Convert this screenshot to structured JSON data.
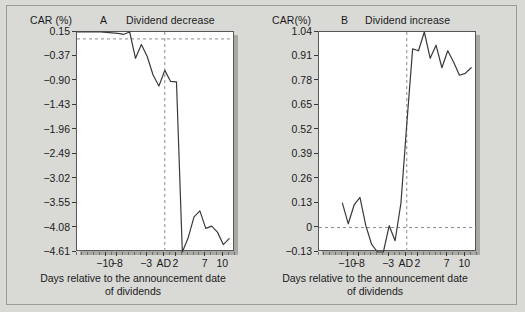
{
  "figure": {
    "background_color": "#d9d9d6",
    "plot_background_color": "#ffffff",
    "line_color": "#3a3a3a",
    "guide_color": "#8c8c8c"
  },
  "chart_data": [
    {
      "type": "line",
      "panel": "A",
      "title": "Dividend decrease",
      "ylabel": "CAR (%)",
      "xlabel": "Days relative to the announcement date of dividends",
      "xlabel_line1": "Days relative to the announcement date",
      "xlabel_line2": "of dividends",
      "ylim": [
        -4.61,
        0.15
      ],
      "ytick_labels": [
        "0.15",
        "−0.37",
        "−0.90",
        "−1.43",
        "−1.96",
        "−2.49",
        "−3.02",
        "−3.55",
        "−4.08",
        "−4.61"
      ],
      "ytick_values": [
        0.15,
        -0.37,
        -0.9,
        -1.43,
        -1.96,
        -2.49,
        -3.02,
        -3.55,
        -4.08,
        -4.61
      ],
      "xlim": [
        -15,
        12
      ],
      "xtick_labels": [
        "−10",
        "−8",
        "−3",
        "AD",
        "2",
        "7",
        "10"
      ],
      "xtick_values": [
        -10,
        -8,
        -3,
        0,
        2,
        7,
        10
      ],
      "grid": false,
      "legend": "none",
      "annotations": [
        {
          "kind": "hline",
          "value": 0.0,
          "style": "dashed"
        },
        {
          "kind": "vline",
          "value": 0,
          "style": "dashed",
          "label": "AD"
        }
      ],
      "x": [
        -15,
        -14,
        -13,
        -12,
        -11,
        -10,
        -9,
        -8,
        -7,
        -6,
        -5,
        -4,
        -3,
        -2,
        -1,
        0,
        1,
        2,
        3,
        4,
        5,
        6,
        7,
        8,
        9,
        10,
        11
      ],
      "values": [
        0.15,
        0.15,
        0.15,
        0.15,
        0.15,
        0.14,
        0.13,
        0.12,
        0.1,
        0.15,
        -0.42,
        -0.12,
        -0.38,
        -0.78,
        -1.02,
        -0.68,
        -0.92,
        -0.93,
        -4.61,
        -4.3,
        -3.85,
        -3.72,
        -4.1,
        -4.05,
        -4.18,
        -4.45,
        -4.32
      ]
    },
    {
      "type": "line",
      "panel": "B",
      "title": "Dividend increase",
      "ylabel": "CAR(%)",
      "xlabel": "Days relative to the announcement date of dividends",
      "xlabel_line1": "Days relative to the announcement date",
      "xlabel_line2": "of dividends",
      "ylim": [
        -0.13,
        1.04
      ],
      "ytick_labels": [
        "1.04",
        "0.91",
        "0.78",
        "0.65",
        "0.52",
        "0.39",
        "0.26",
        "0.13",
        "0",
        "−0.13"
      ],
      "ytick_values": [
        1.04,
        0.91,
        0.78,
        0.65,
        0.52,
        0.39,
        0.26,
        0.13,
        0.0,
        -0.13
      ],
      "xlim": [
        -15,
        12
      ],
      "xtick_labels": [
        "−10",
        "−8",
        "−3",
        "AD",
        "2",
        "7",
        "10"
      ],
      "xtick_values": [
        -10,
        -8,
        -3,
        0,
        2,
        7,
        10
      ],
      "grid": false,
      "legend": "none",
      "annotations": [
        {
          "kind": "hline",
          "value": 0.0,
          "style": "dashed"
        },
        {
          "kind": "vline",
          "value": 0,
          "style": "dashed",
          "label": "AD"
        }
      ],
      "x": [
        -11,
        -10,
        -9,
        -8,
        -7,
        -6,
        -5,
        -4,
        -3,
        -2,
        -1,
        0,
        1,
        2,
        3,
        4,
        5,
        6,
        7,
        8,
        9,
        10,
        11
      ],
      "values": [
        0.13,
        0.02,
        0.12,
        0.16,
        0.01,
        -0.09,
        -0.13,
        -0.13,
        0.01,
        -0.07,
        0.13,
        0.55,
        0.95,
        0.94,
        1.04,
        0.9,
        0.97,
        0.85,
        0.94,
        0.88,
        0.81,
        0.82,
        0.85
      ]
    }
  ]
}
